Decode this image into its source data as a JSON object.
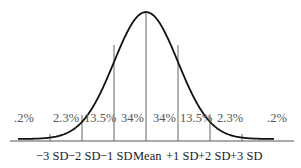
{
  "figure": {
    "percentages": [
      ".2%",
      "2.3%",
      "13.5%",
      "34%",
      "34%",
      "13.5%",
      "2.3%",
      ".2%"
    ],
    "sd_labels": [
      "−3 SD",
      "−2 SD",
      "−1 SD",
      "Mean",
      "+1 SD",
      "+2 SD",
      "+3 SD"
    ]
  },
  "colors": {
    "curve": "#111111",
    "dividers": "#555555",
    "percent_text": "#555555",
    "axis_text": "#222222",
    "background": "#ffffff"
  }
}
